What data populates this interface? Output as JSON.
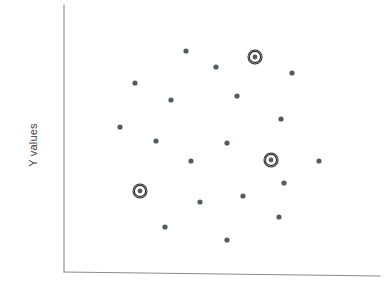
{
  "chart_data": {
    "type": "scatter",
    "title": "",
    "subtitle": "",
    "xlabel": "",
    "ylabel": "Y values",
    "grid": false,
    "legend": null,
    "xlim": [
      0,
      386
    ],
    "ylim": [
      0,
      290
    ],
    "axis": {
      "y_axis": {
        "x": 64,
        "y_top": 5,
        "y_bottom": 272
      },
      "x_axis": {
        "x_left": 64,
        "x_right": 380,
        "y_left": 272,
        "y_right": 276
      }
    },
    "marker": {
      "dot_radius": 2.6,
      "dot_color": "#555a5e",
      "ring_outer_radius": 7.0,
      "ring_inner_radius": 5.6,
      "ring_color": "#2b2b2b",
      "ring_dot_radius": 2.4
    },
    "points": [
      {
        "x": 186,
        "y": 51,
        "highlighted": false
      },
      {
        "x": 255,
        "y": 57,
        "highlighted": true
      },
      {
        "x": 216,
        "y": 67,
        "highlighted": false
      },
      {
        "x": 292,
        "y": 73,
        "highlighted": false
      },
      {
        "x": 135,
        "y": 83,
        "highlighted": false
      },
      {
        "x": 237,
        "y": 96,
        "highlighted": false
      },
      {
        "x": 171,
        "y": 100,
        "highlighted": false
      },
      {
        "x": 281,
        "y": 119,
        "highlighted": false
      },
      {
        "x": 120,
        "y": 127,
        "highlighted": false
      },
      {
        "x": 156,
        "y": 141,
        "highlighted": false
      },
      {
        "x": 227,
        "y": 143,
        "highlighted": false
      },
      {
        "x": 191,
        "y": 161,
        "highlighted": false
      },
      {
        "x": 271,
        "y": 160,
        "highlighted": true
      },
      {
        "x": 319,
        "y": 161,
        "highlighted": false
      },
      {
        "x": 284,
        "y": 183,
        "highlighted": false
      },
      {
        "x": 140,
        "y": 191,
        "highlighted": true
      },
      {
        "x": 243,
        "y": 196,
        "highlighted": false
      },
      {
        "x": 200,
        "y": 202,
        "highlighted": false
      },
      {
        "x": 279,
        "y": 217,
        "highlighted": false
      },
      {
        "x": 165,
        "y": 227,
        "highlighted": false
      },
      {
        "x": 227,
        "y": 240,
        "highlighted": false
      }
    ],
    "highlighted_count": 3,
    "total_points": 21
  },
  "axes": {
    "y_label": "Y values",
    "x_label": ""
  },
  "colors": {
    "axis": "#8a8a8a",
    "dot": "#555a5e",
    "ring": "#2b2b2b",
    "background": "#ffffff",
    "label_text": "#3c3c3c"
  }
}
